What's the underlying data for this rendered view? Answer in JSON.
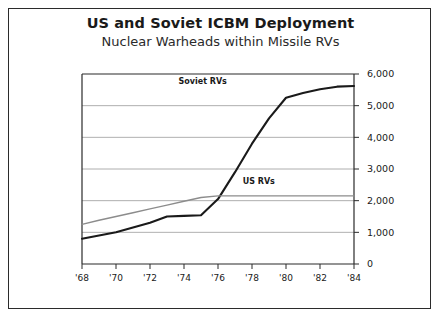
{
  "frame": {
    "border_color": "#2b2b2b",
    "background": "#ffffff"
  },
  "header": {
    "title": "US and Soviet ICBM Deployment",
    "subtitle": "Nuclear Warheads within Missile RVs"
  },
  "chart_data": {
    "type": "line",
    "title": "US and Soviet ICBM Deployment",
    "subtitle": "Nuclear Warheads within Missile RVs",
    "xlabel": "",
    "ylabel": "",
    "xlim": [
      1968,
      1984
    ],
    "ylim": [
      0,
      6000
    ],
    "grid": true,
    "grid_axis": "y",
    "y_axis_position": "right",
    "legend": "inline-annotations",
    "ytick_labels": [
      "0",
      "1,000",
      "2,000",
      "3,000",
      "4,000",
      "5,000",
      "6,000"
    ],
    "ytick_values": [
      0,
      1000,
      2000,
      3000,
      4000,
      5000,
      6000
    ],
    "xtick_labels": [
      "'68",
      "'70",
      "'72",
      "'74",
      "'76",
      "'78",
      "'80",
      "'82",
      "'84"
    ],
    "xtick_values": [
      1968,
      1970,
      1972,
      1974,
      1976,
      1978,
      1980,
      1982,
      1984
    ],
    "x": [
      1968,
      1969,
      1970,
      1971,
      1972,
      1973,
      1974,
      1975,
      1976,
      1977,
      1978,
      1979,
      1980,
      1981,
      1982,
      1983,
      1984
    ],
    "series": [
      {
        "name": "Soviet RVs",
        "color": "#1a1a1a",
        "width": 2.1,
        "label_x": 1975.1,
        "label_y": 5700,
        "values": [
          800,
          900,
          1000,
          1150,
          1300,
          1500,
          1520,
          1540,
          2050,
          2900,
          3800,
          4600,
          5250,
          5400,
          5520,
          5600,
          5620
        ]
      },
      {
        "name": "US RVs",
        "color": "#8c8c8c",
        "width": 1.4,
        "label_x": 1978.4,
        "label_y": 2520,
        "values": [
          1250,
          1380,
          1500,
          1620,
          1740,
          1860,
          1980,
          2100,
          2150,
          2150,
          2150,
          2150,
          2150,
          2150,
          2150,
          2150,
          2150
        ]
      }
    ],
    "annotations": [
      {
        "text": "Soviet RVs",
        "x": 1975.1,
        "y": 5700
      },
      {
        "text": "US RVs",
        "x": 1978.4,
        "y": 2520
      }
    ]
  }
}
